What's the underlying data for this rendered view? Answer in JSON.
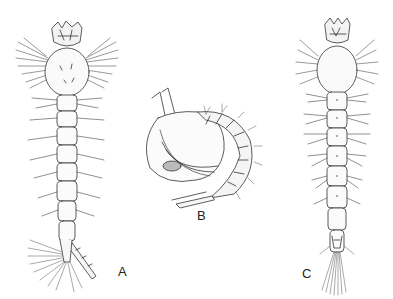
{
  "figure": {
    "background": "#ffffff",
    "stroke_color": "#333333",
    "panels": [
      {
        "id": "A",
        "label": "A",
        "subject": "larva-dorsal-view-with-siphon"
      },
      {
        "id": "B",
        "label": "B",
        "subject": "pupa-lateral-view"
      },
      {
        "id": "C",
        "label": "C",
        "subject": "larva-dorsal-view-without-siphon"
      }
    ]
  }
}
